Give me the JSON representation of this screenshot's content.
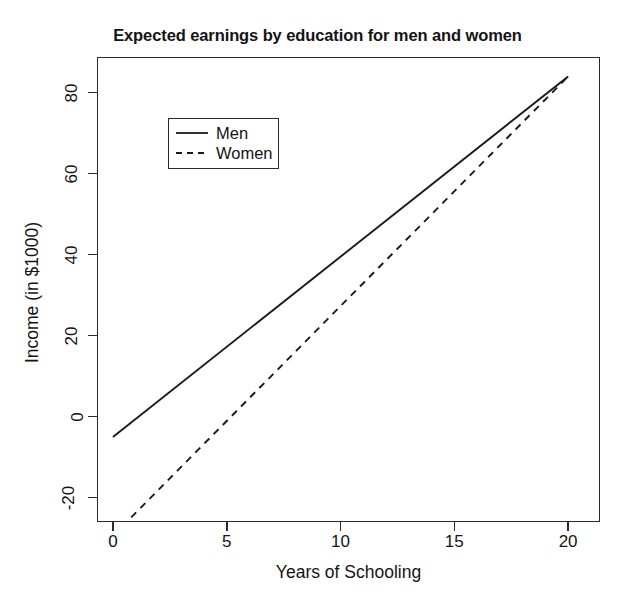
{
  "chart_data": {
    "type": "line",
    "title": "Expected earnings by education for men and women",
    "xlabel": "Years of Schooling",
    "ylabel": "Income (in $1000)",
    "xlim": [
      -0.7,
      21.4
    ],
    "ylim": [
      -26.0,
      88.8
    ],
    "xticks": [
      0,
      5,
      10,
      15,
      20
    ],
    "xticklabels": [
      "0",
      "5",
      "10",
      "15",
      "20"
    ],
    "yticks": [
      -20,
      0,
      20,
      40,
      60,
      80
    ],
    "yticklabels": [
      "-20",
      "0",
      "20",
      "40",
      "60",
      "80"
    ],
    "grid": false,
    "legend_position": "upper left",
    "series": [
      {
        "name": "Men",
        "style": "solid",
        "color": "#1a1a1a",
        "x": [
          0,
          5,
          10,
          15,
          20
        ],
        "y": [
          -5,
          17.3,
          39.5,
          61.8,
          84
        ]
      },
      {
        "name": "Women",
        "style": "dashed",
        "color": "#1a1a1a",
        "x": [
          0,
          5,
          10,
          15,
          20
        ],
        "y": [
          -29.4,
          -1.1,
          27.2,
          55.7,
          84
        ]
      }
    ]
  },
  "legend": {
    "items": [
      {
        "label": "Men"
      },
      {
        "label": "Women"
      }
    ]
  },
  "colors": {
    "line": "#1a1a1a",
    "axis": "#2b2b2b",
    "background": "#ffffff"
  }
}
